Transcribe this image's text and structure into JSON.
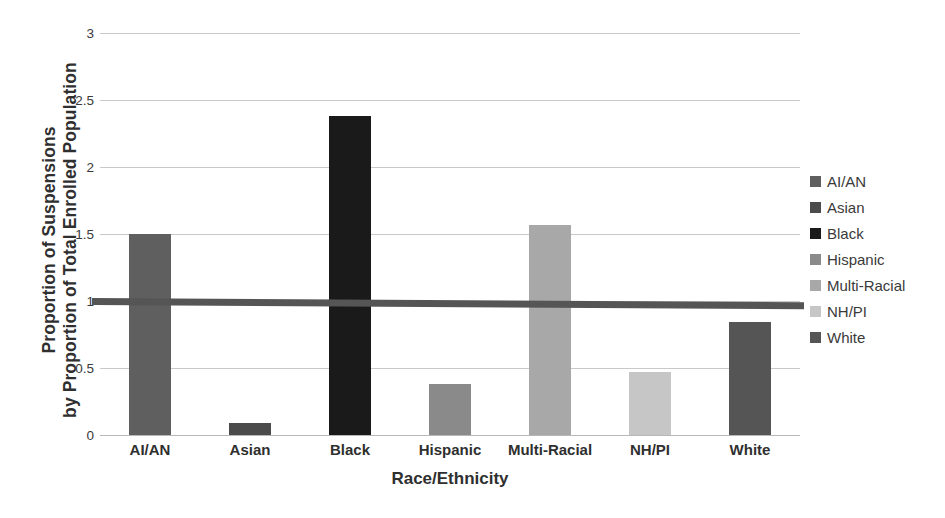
{
  "chart_data": {
    "type": "bar",
    "title": "",
    "xlabel": "Race/Ethnicity",
    "ylabel": "Proportion of Suspensions by Proportion of Total Enrolled Population",
    "ylabel_lines": [
      "Proportion of Suspensions",
      "by Proportion of Total Enrolled Population"
    ],
    "categories": [
      "AI/AN",
      "Asian",
      "Black",
      "Hispanic",
      "Multi-Racial",
      "NH/PI",
      "White"
    ],
    "values": [
      1.5,
      0.09,
      2.38,
      0.38,
      1.57,
      0.47,
      0.84
    ],
    "colors": [
      "#5f5f5f",
      "#4b4b4b",
      "#1a1a1a",
      "#8a8a8a",
      "#a8a8a8",
      "#c6c6c6",
      "#555555"
    ],
    "ylim": [
      0,
      3
    ],
    "yticks": [
      0,
      0.5,
      1,
      1.5,
      2,
      2.5,
      3
    ],
    "ytick_labels": [
      "0",
      "0.5",
      "1",
      "1.5",
      "2",
      "2.5",
      "3"
    ],
    "grid": true,
    "grid_axis": "y",
    "legend_position": "right",
    "legend_entries": [
      {
        "label": "AI/AN",
        "color": "#5f5f5f"
      },
      {
        "label": "Asian",
        "color": "#4b4b4b"
      },
      {
        "label": "Black",
        "color": "#1a1a1a"
      },
      {
        "label": "Hispanic",
        "color": "#8a8a8a"
      },
      {
        "label": "Multi-Racial",
        "color": "#a8a8a8"
      },
      {
        "label": "NH/PI",
        "color": "#c6c6c6"
      },
      {
        "label": "White",
        "color": "#555555"
      }
    ],
    "reference_line": {
      "name": "parity-line",
      "value": 1,
      "color": "#555555",
      "style": "thick-solid"
    },
    "background_color": "#ffffff",
    "gridline_color": "#c9c9c9"
  }
}
